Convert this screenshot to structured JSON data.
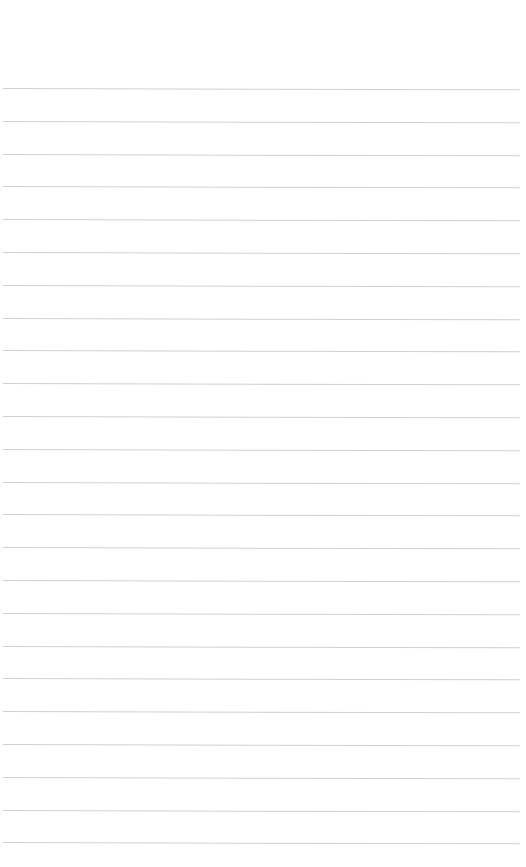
{
  "page": {
    "type": "lined-paper",
    "background_color": "#ffffff",
    "line_color": "#cfcfcf",
    "line_count": 24,
    "first_line_y": 88,
    "line_spacing": 32.8,
    "text": ""
  }
}
